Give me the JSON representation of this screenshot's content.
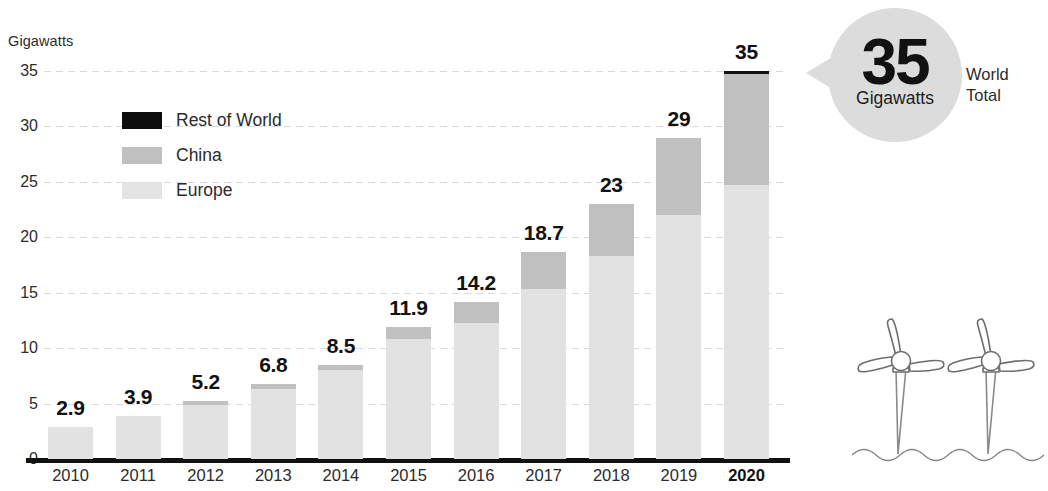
{
  "axis_title": "Gigawatts",
  "legend": {
    "items": [
      {
        "key": "rest_of_world",
        "label": "Rest of World",
        "color": "#0d0d0d"
      },
      {
        "key": "china",
        "label": "China",
        "color": "#c0c0c0"
      },
      {
        "key": "europe",
        "label": "Europe",
        "color": "#e4e4e4"
      }
    ]
  },
  "callout": {
    "value": "35",
    "unit": "Gigawatts",
    "side_line1": "World",
    "side_line2": "Total"
  },
  "chart_data": {
    "type": "bar",
    "stacked": true,
    "title": "",
    "xlabel": "",
    "ylabel": "Gigawatts",
    "ylim": [
      0,
      35
    ],
    "yticks": [
      0,
      5,
      10,
      15,
      20,
      25,
      30,
      35
    ],
    "ytick_labels": [
      "0",
      "5",
      "10",
      "15",
      "20",
      "25",
      "30",
      "35"
    ],
    "grid": true,
    "legend_position": "upper-left",
    "categories": [
      "2010",
      "2011",
      "2012",
      "2013",
      "2014",
      "2015",
      "2016",
      "2017",
      "2018",
      "2019",
      "2020"
    ],
    "highlight_category": "2020",
    "values": [
      2.9,
      3.9,
      5.2,
      6.8,
      8.5,
      11.9,
      14.2,
      18.7,
      23,
      29,
      35
    ],
    "data_labels": [
      "2.9",
      "3.9",
      "5.2",
      "6.8",
      "8.5",
      "11.9",
      "14.2",
      "18.7",
      "23",
      "29",
      "35"
    ],
    "series": [
      {
        "name": "Europe",
        "color": "#e2e2e2",
        "values": [
          2.9,
          3.9,
          4.9,
          6.3,
          8.0,
          10.8,
          12.3,
          15.3,
          18.3,
          22.0,
          24.7
        ]
      },
      {
        "name": "China",
        "color": "#c0c0c0",
        "values": [
          0.0,
          0.0,
          0.3,
          0.5,
          0.5,
          1.1,
          1.9,
          3.4,
          4.7,
          7.0,
          10.3
        ]
      },
      {
        "name": "Rest of World",
        "color": "#111111",
        "values": [
          0,
          0,
          0,
          0,
          0,
          0,
          0,
          0,
          0,
          0,
          0
        ]
      }
    ]
  }
}
